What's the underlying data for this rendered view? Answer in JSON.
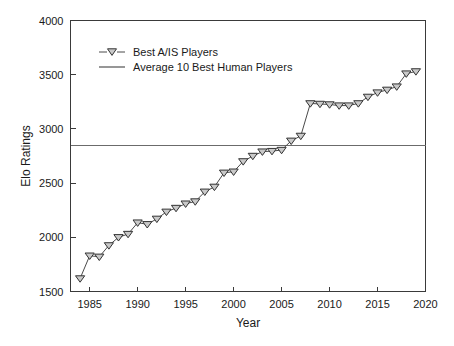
{
  "chart_data": {
    "type": "line",
    "title": "",
    "xlabel": "Year",
    "ylabel": "Elo Ratings",
    "xlim": [
      1983,
      2020
    ],
    "ylim": [
      1500,
      4000
    ],
    "xticks": [
      1985,
      1990,
      1995,
      2000,
      2005,
      2010,
      2015,
      2020
    ],
    "xtick_labels": [
      "1985",
      "1990",
      "1995",
      "2000",
      "2005",
      "2010",
      "2015",
      "2020"
    ],
    "yticks": [
      1500,
      2000,
      2500,
      3000,
      3500,
      4000
    ],
    "ytick_labels": [
      "1500",
      "2000",
      "2500",
      "3000",
      "3500",
      "4000"
    ],
    "grid": false,
    "legend_position": "upper-left",
    "series": [
      {
        "name": "Best A/IS Players",
        "marker": "triangle-down",
        "marker_fill": "#c9c9c9",
        "marker_stroke": "#333333",
        "line_color": "#4a4a4a",
        "x": [
          1984,
          1985,
          1986,
          1987,
          1988,
          1989,
          1990,
          1991,
          1992,
          1993,
          1994,
          1995,
          1996,
          1997,
          1998,
          1999,
          2000,
          2001,
          2002,
          2003,
          2004,
          2005,
          2006,
          2007,
          2008,
          2009,
          2010,
          2011,
          2012,
          2013,
          2014,
          2015,
          2016,
          2017,
          2018,
          2019
        ],
        "values": [
          1620,
          1830,
          1820,
          1925,
          2000,
          2030,
          2135,
          2120,
          2170,
          2235,
          2270,
          2310,
          2330,
          2420,
          2465,
          2595,
          2605,
          2700,
          2750,
          2790,
          2795,
          2805,
          2890,
          2935,
          3235,
          3230,
          3225,
          3215,
          3215,
          3235,
          3295,
          3335,
          3360,
          3390,
          3510,
          3530
        ]
      },
      {
        "name": "Average 10 Best Human Players",
        "marker": "none",
        "line_color": "#6b6b6b",
        "type": "horizontal-reference",
        "value": 2845
      }
    ]
  },
  "legend": {
    "items": [
      {
        "label": "Best A/IS Players",
        "icon": "triangle-down-marker-icon"
      },
      {
        "label": "Average 10 Best Human Players",
        "icon": "solid-line-icon"
      }
    ]
  },
  "axes": {
    "x_title": "Year",
    "y_title": "Elo Ratings"
  },
  "colors": {
    "axis": "#3a3a3a",
    "series_line": "#4a4a4a",
    "marker_fill": "#c9c9c9",
    "marker_stroke": "#333333",
    "reference_line": "#6b6b6b",
    "background": "#ffffff"
  }
}
